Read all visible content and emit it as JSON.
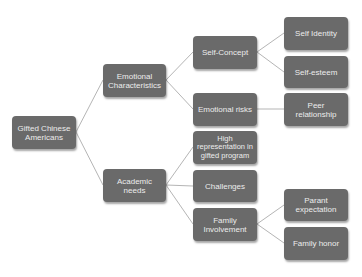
{
  "diagram": {
    "type": "tree",
    "colors": {
      "node_fill": "#6a6a6a",
      "node_text": "#ececec",
      "link": "#b5b5b5"
    },
    "nodes": {
      "root": {
        "label": "Gifted Chinese Americans"
      },
      "emotional": {
        "label": "Emotional Characteristics"
      },
      "academic": {
        "label": "Academic needs"
      },
      "self_concept": {
        "label": "Self-Concept"
      },
      "emotional_risks": {
        "label": "Emotional risks"
      },
      "high_rep": {
        "label": "High representation in gifted program"
      },
      "challenges": {
        "label": "Challenges"
      },
      "family_inv": {
        "label": "Family Involvement"
      },
      "self_identity": {
        "label": "Self Identity"
      },
      "self_esteem": {
        "label": "Self-esteem"
      },
      "peer": {
        "label": "Peer relationship"
      },
      "parent_exp": {
        "label": "Parant expectation"
      },
      "family_honor": {
        "label": "Family honor"
      }
    },
    "edges": [
      [
        "root",
        "emotional"
      ],
      [
        "root",
        "academic"
      ],
      [
        "emotional",
        "self_concept"
      ],
      [
        "emotional",
        "emotional_risks"
      ],
      [
        "self_concept",
        "self_identity"
      ],
      [
        "self_concept",
        "self_esteem"
      ],
      [
        "emotional_risks",
        "peer"
      ],
      [
        "academic",
        "high_rep"
      ],
      [
        "academic",
        "challenges"
      ],
      [
        "academic",
        "family_inv"
      ],
      [
        "family_inv",
        "parent_exp"
      ],
      [
        "family_inv",
        "family_honor"
      ]
    ]
  }
}
